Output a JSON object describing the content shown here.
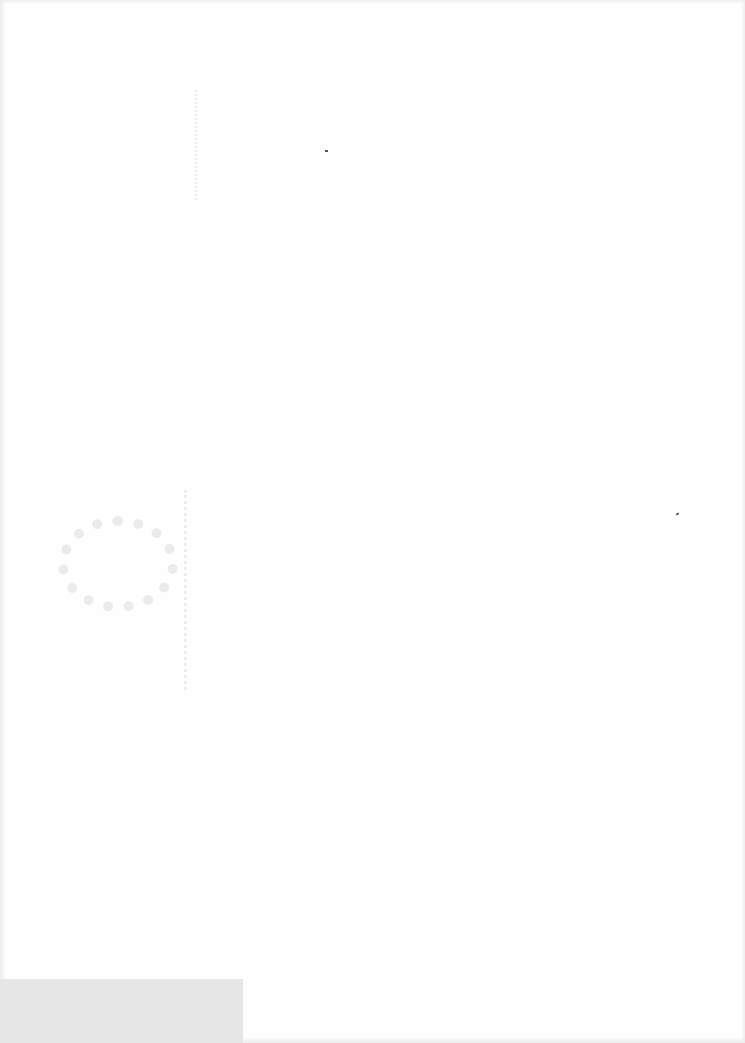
{
  "document": {
    "type": "scanned-blank-page",
    "text": "",
    "marks": [
      {
        "name": "circular-smudge",
        "position": "left-middle"
      },
      {
        "name": "speck",
        "position": "upper-center"
      },
      {
        "name": "speck",
        "position": "right-middle"
      },
      {
        "name": "grey-block",
        "position": "bottom-left"
      }
    ]
  }
}
